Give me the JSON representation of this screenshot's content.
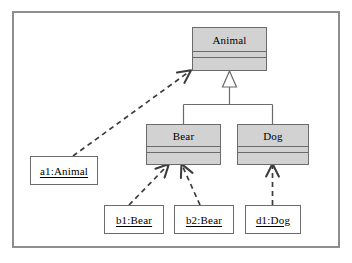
{
  "diagram": {
    "kind": "uml-class-object-diagram",
    "frame": {
      "border_color": "#8e8e8e",
      "background": "#ffffff"
    },
    "class_fill": "#d2d2d2",
    "class_stroke": "#6b6b6b",
    "object_fill": "#ffffff",
    "object_stroke": "#6b6b6b",
    "line_color": "#4a4a4a"
  },
  "classes": [
    {
      "id": "animal",
      "name": "Animal"
    },
    {
      "id": "bear",
      "name": "Bear"
    },
    {
      "id": "dog",
      "name": "Dog"
    }
  ],
  "objects": [
    {
      "id": "a1",
      "label": "a1:Animal"
    },
    {
      "id": "b1",
      "label": "b1:Bear"
    },
    {
      "id": "b2",
      "label": "b2:Bear"
    },
    {
      "id": "d1",
      "label": "d1:Dog"
    }
  ],
  "relationships": [
    {
      "type": "generalization",
      "from": "Bear",
      "to": "Animal",
      "style": "solid",
      "arrowhead": "hollow-triangle"
    },
    {
      "type": "generalization",
      "from": "Dog",
      "to": "Animal",
      "style": "solid",
      "arrowhead": "hollow-triangle"
    },
    {
      "type": "instance-of",
      "from": "a1:Animal",
      "to": "Animal",
      "style": "dashed",
      "arrowhead": "open"
    },
    {
      "type": "instance-of",
      "from": "b1:Bear",
      "to": "Bear",
      "style": "dashed",
      "arrowhead": "open"
    },
    {
      "type": "instance-of",
      "from": "b2:Bear",
      "to": "Bear",
      "style": "dashed",
      "arrowhead": "open"
    },
    {
      "type": "instance-of",
      "from": "d1:Dog",
      "to": "Dog",
      "style": "dashed",
      "arrowhead": "open"
    }
  ]
}
